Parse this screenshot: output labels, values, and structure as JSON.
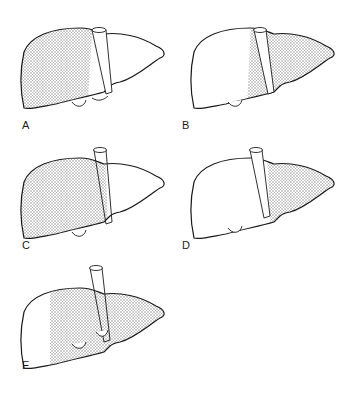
{
  "figure": {
    "type": "liver-resection-diagram",
    "colors": {
      "outline": "#1a1a1a",
      "shading": "#9a9a9a",
      "background": "#ffffff"
    },
    "panels": [
      {
        "label": "A",
        "shaded": "right-lobe"
      },
      {
        "label": "B",
        "shaded": "left-lobe-and-medial-segment"
      },
      {
        "label": "C",
        "shaded": "extended-right-lobe"
      },
      {
        "label": "D",
        "shaded": "left-lateral-segment"
      },
      {
        "label": "E",
        "shaded": "extended-left-lobe"
      }
    ]
  }
}
